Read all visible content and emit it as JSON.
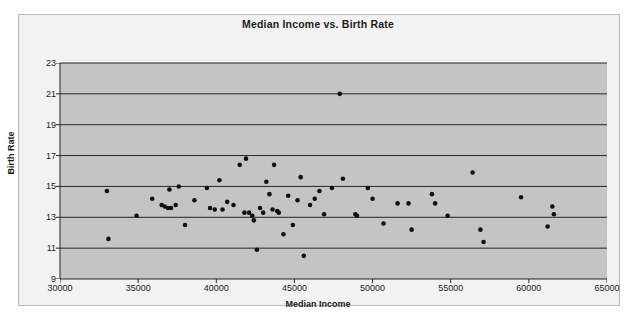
{
  "chart_data": {
    "type": "scatter",
    "title": "Median Income vs. Birth Rate",
    "xlabel": "Median Income",
    "ylabel": "Birth Rate",
    "xlim": [
      30000,
      65000
    ],
    "ylim": [
      9,
      23
    ],
    "xticks": [
      30000,
      35000,
      40000,
      45000,
      50000,
      55000,
      60000,
      65000
    ],
    "yticks": [
      9,
      11,
      13,
      15,
      17,
      19,
      21,
      23
    ],
    "xtick_labels": [
      "30000",
      "35000",
      "40000",
      "45000",
      "50000",
      "55000",
      "60000",
      "65000"
    ],
    "ytick_labels": [
      "9",
      "11",
      "13",
      "15",
      "17",
      "19",
      "21",
      "23"
    ],
    "grid": "horizontal",
    "legend": null,
    "plot_background": "#c4c4c4",
    "marker_color": "#111111",
    "series": [
      {
        "name": "States",
        "points": [
          [
            33000,
            14.7
          ],
          [
            33100,
            11.6
          ],
          [
            34900,
            13.1
          ],
          [
            35900,
            14.2
          ],
          [
            36500,
            13.8
          ],
          [
            36700,
            13.7
          ],
          [
            36900,
            13.6
          ],
          [
            37000,
            14.8
          ],
          [
            37100,
            13.6
          ],
          [
            37400,
            13.8
          ],
          [
            37600,
            15.0
          ],
          [
            38000,
            12.5
          ],
          [
            38600,
            14.1
          ],
          [
            39400,
            14.9
          ],
          [
            39600,
            13.6
          ],
          [
            39900,
            13.5
          ],
          [
            40200,
            15.4
          ],
          [
            40400,
            13.5
          ],
          [
            40700,
            14.0
          ],
          [
            41100,
            13.8
          ],
          [
            41500,
            16.4
          ],
          [
            41800,
            13.3
          ],
          [
            41900,
            16.8
          ],
          [
            42100,
            13.3
          ],
          [
            42300,
            13.1
          ],
          [
            42400,
            12.8
          ],
          [
            42600,
            10.9
          ],
          [
            42800,
            13.6
          ],
          [
            43000,
            13.3
          ],
          [
            43200,
            15.3
          ],
          [
            43400,
            14.5
          ],
          [
            43600,
            13.5
          ],
          [
            43700,
            16.4
          ],
          [
            43900,
            13.4
          ],
          [
            44000,
            13.3
          ],
          [
            44300,
            11.9
          ],
          [
            44600,
            14.4
          ],
          [
            44900,
            12.5
          ],
          [
            45200,
            14.1
          ],
          [
            45400,
            15.6
          ],
          [
            45600,
            10.5
          ],
          [
            46000,
            13.8
          ],
          [
            46300,
            14.2
          ],
          [
            46600,
            14.7
          ],
          [
            46900,
            13.2
          ],
          [
            47400,
            14.9
          ],
          [
            47900,
            21.0
          ],
          [
            48100,
            15.5
          ],
          [
            48900,
            13.2
          ],
          [
            49000,
            13.1
          ],
          [
            49700,
            14.9
          ],
          [
            50000,
            14.2
          ],
          [
            50700,
            12.6
          ],
          [
            51600,
            13.9
          ],
          [
            52300,
            13.9
          ],
          [
            52500,
            12.2
          ],
          [
            53800,
            14.5
          ],
          [
            54000,
            13.9
          ],
          [
            54800,
            13.1
          ],
          [
            56400,
            15.9
          ],
          [
            56900,
            12.2
          ],
          [
            57100,
            11.4
          ],
          [
            59500,
            14.3
          ],
          [
            61200,
            12.4
          ],
          [
            61500,
            13.7
          ],
          [
            61600,
            13.2
          ]
        ]
      }
    ]
  }
}
